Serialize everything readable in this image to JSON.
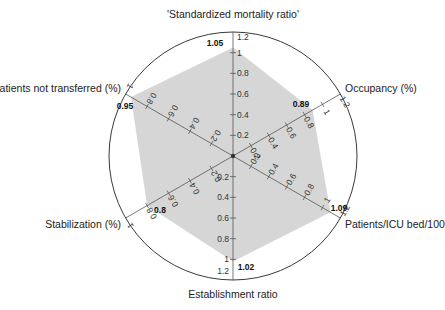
{
  "chart_data": {
    "type": "radar",
    "title": "",
    "center": [
      233,
      156
    ],
    "radius": 124,
    "polygon_fill": "#d6d6d6",
    "axis_color": "#555555",
    "circle_color": "#222222",
    "axes": [
      {
        "name": "'Standardized mortality ratio'",
        "angle": 90,
        "max": 1.2,
        "ticks": [
          0.2,
          0.4,
          0.6,
          0.8,
          1,
          1.2
        ],
        "value": 1.05,
        "value_label": "1.05"
      },
      {
        "name": "Occupancy (%)",
        "angle": 30,
        "max": 1.2,
        "ticks": [
          0.2,
          0.4,
          0.6,
          0.8,
          1,
          1.2
        ],
        "value": 0.89,
        "value_label": "0.89"
      },
      {
        "name": "Patients/ICU bed/100",
        "angle": -30,
        "max": 1.2,
        "ticks": [
          0.2,
          0.4,
          0.6,
          0.8,
          1,
          1.2
        ],
        "value": 1.09,
        "value_label": "1.09"
      },
      {
        "name": "Establishment ratio",
        "angle": -90,
        "max": 1.2,
        "ticks": [
          0.2,
          0.4,
          0.6,
          0.8,
          1,
          1.2
        ],
        "value": 1.02,
        "value_label": "1.02"
      },
      {
        "name": "Stabilization (%)",
        "angle": -150,
        "max": 1.0,
        "ticks": [
          0.2,
          0.4,
          0.6,
          0.8,
          1
        ],
        "value": 0.8,
        "value_label": "0.8"
      },
      {
        "name": "Patients not transferred (%)",
        "angle": 150,
        "max": 1.0,
        "ticks": [
          0.2,
          0.4,
          0.6,
          0.8,
          1
        ],
        "value": 0.95,
        "value_label": "0.95"
      }
    ],
    "categories": [
      "'Standardized mortality ratio'",
      "Occupancy (%)",
      "Patients/ICU bed/100",
      "Establishment ratio",
      "Stabilization (%)",
      "Patients not transferred (%)"
    ],
    "values": [
      1.05,
      0.89,
      1.09,
      1.02,
      0.8,
      0.95
    ],
    "legend": null,
    "grid": false
  },
  "labels": {
    "smr": "'Standardized mortality ratio'",
    "occupancy": "Occupancy (%)",
    "icu": "Patients/ICU bed/100",
    "establishment": "Establishment ratio",
    "stabilization": "Stabilization (%)",
    "not_transferred": "Patients not transferred (%)"
  },
  "values": {
    "smr": "1.05",
    "occupancy": "0.89",
    "icu": "1.09",
    "establishment": "1.02",
    "stabilization": "0.8",
    "not_transferred": "0.95"
  }
}
